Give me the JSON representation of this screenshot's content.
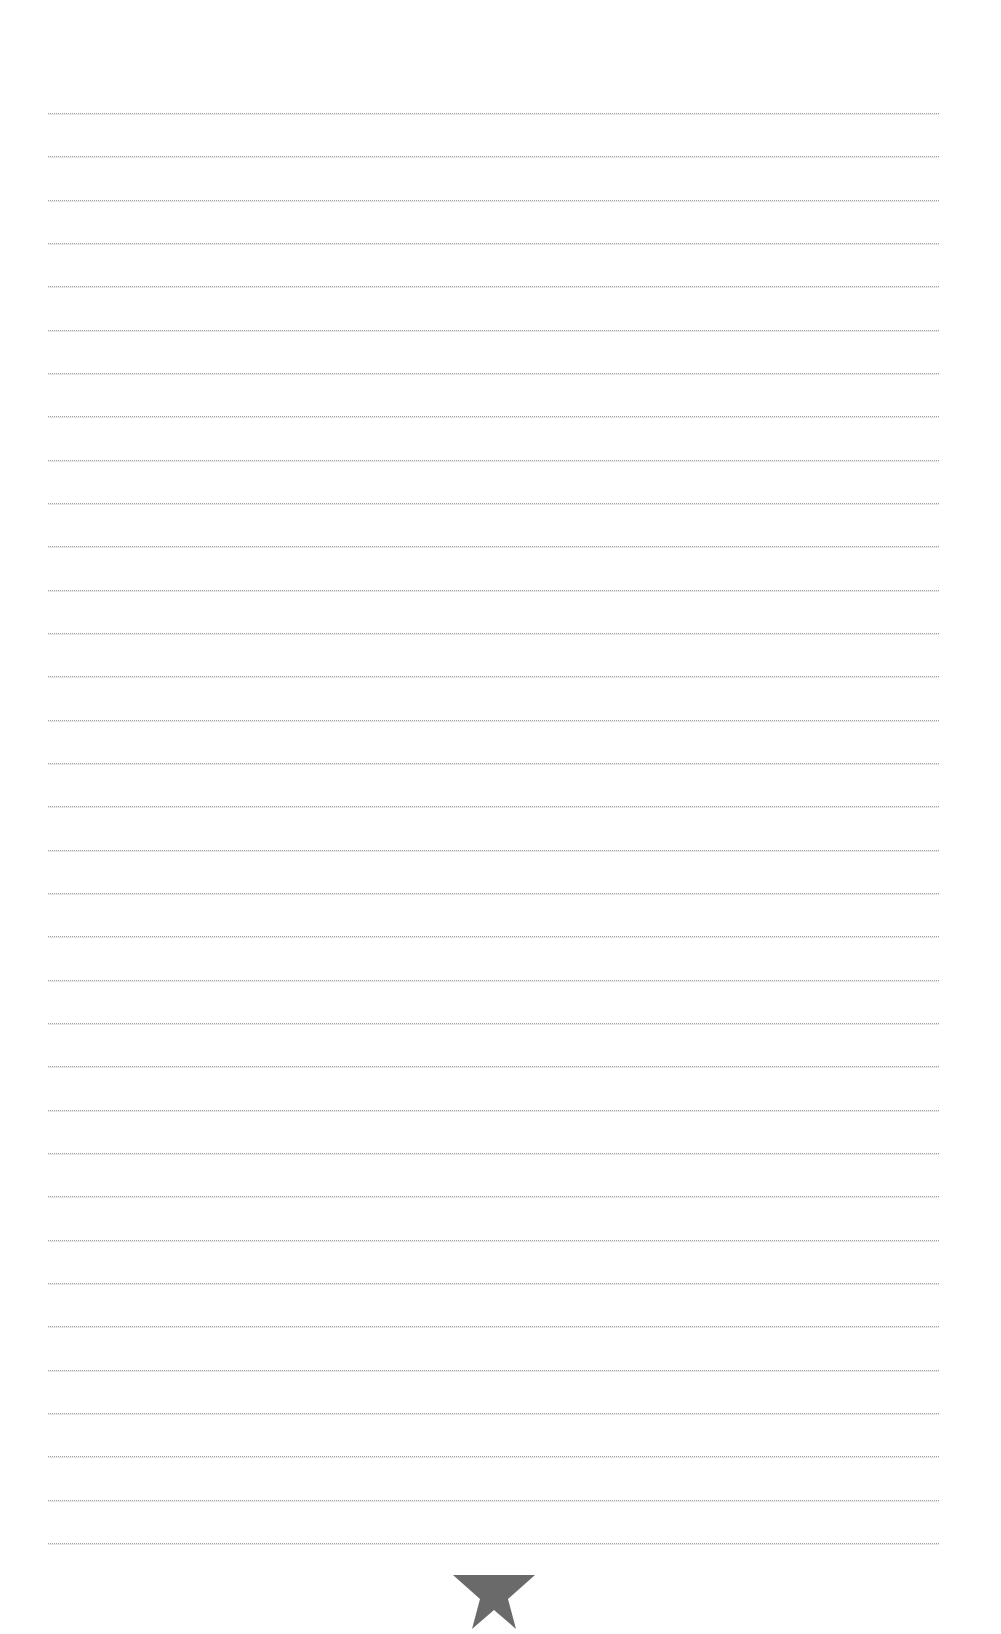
{
  "page": {
    "type": "lined-paper",
    "background_color": "#ffffff",
    "rule_color": "#9c9c9c",
    "rule_count": 34,
    "rule_first_y": 113,
    "rule_spacing": 43.33,
    "rule_left": 48,
    "rule_right": 939
  },
  "footer": {
    "icon": "star-icon",
    "icon_color": "#6a6a6a"
  }
}
